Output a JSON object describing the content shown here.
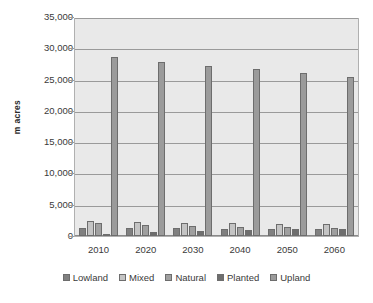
{
  "chart_data": {
    "type": "bar",
    "title": "",
    "subtitle": "",
    "xlabel": "",
    "ylabel": "m acres",
    "categories": [
      "2010",
      "2020",
      "2030",
      "2040",
      "2050",
      "2060"
    ],
    "series": [
      {
        "name": "Lowland",
        "color": "#808080",
        "values": [
          1300,
          1300,
          1250,
          1200,
          1200,
          1150
        ]
      },
      {
        "name": "Mixed",
        "color": "#c4c4c4",
        "values": [
          2400,
          2250,
          2150,
          2050,
          1950,
          1900
        ]
      },
      {
        "name": "Natural",
        "color": "#a0a0a0",
        "values": [
          2100,
          1800,
          1650,
          1500,
          1400,
          1250
        ]
      },
      {
        "name": "Planted",
        "color": "#6e6e6e",
        "values": [
          400,
          700,
          850,
          1000,
          1100,
          1200
        ]
      },
      {
        "name": "Upland",
        "color": "#9b9b9b",
        "values": [
          28800,
          28100,
          27500,
          26900,
          26300,
          25700
        ]
      }
    ],
    "ylim": [
      0,
      35000
    ],
    "yticks": [
      0,
      5000,
      10000,
      15000,
      20000,
      25000,
      30000,
      35000
    ],
    "ytick_labels": [
      "0",
      "5,000",
      "10,000",
      "15,000",
      "20,000",
      "25,000",
      "30,000",
      "35,000"
    ],
    "grid": true,
    "legend_position": "bottom",
    "plot_background": "#e9e9e9",
    "figure_background": "#ffffff"
  }
}
